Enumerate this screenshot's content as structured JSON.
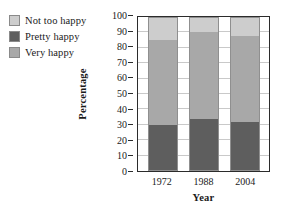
{
  "chart_data": {
    "type": "bar",
    "stacked": true,
    "title": "",
    "xlabel": "Year",
    "ylabel": "Percentage",
    "categories": [
      "1972",
      "1988",
      "2004"
    ],
    "ylim": [
      0,
      100
    ],
    "yticks": [
      0,
      10,
      20,
      30,
      40,
      50,
      60,
      70,
      80,
      90,
      100
    ],
    "grid": true,
    "legend_position": "top-left",
    "series": [
      {
        "name": "Not too happy",
        "values": [
          15,
          10,
          12
        ],
        "color": "#cdcdcd"
      },
      {
        "name": "Pretty happy",
        "values": [
          55,
          56,
          56
        ],
        "color": "#a8a8a8"
      },
      {
        "name": "Very happy",
        "values": [
          30,
          34,
          32
        ],
        "color": "#5e5e5e"
      }
    ],
    "stack_order_bottom_to_top": [
      "Very happy",
      "Pretty happy",
      "Not too happy"
    ],
    "segment_tops": {
      "1972": {
        "very_happy": 30,
        "pretty_happy": 85,
        "not_too_happy": 100
      },
      "1988": {
        "very_happy": 34,
        "pretty_happy": 90,
        "not_too_happy": 100
      },
      "2004": {
        "very_happy": 32,
        "pretty_happy": 88,
        "not_too_happy": 100
      }
    }
  },
  "legend": {
    "items": [
      {
        "label": "Not too happy",
        "color": "#cdcdcd"
      },
      {
        "label": "Pretty happy",
        "color": "#5e5e5e"
      },
      {
        "label": "Very happy",
        "color": "#a8a8a8"
      }
    ]
  },
  "axes": {
    "y_title": "Percentage",
    "x_title": "Year",
    "y_tick_labels": [
      "100",
      "90",
      "80",
      "70",
      "60",
      "50",
      "40",
      "30",
      "20",
      "10",
      "0"
    ],
    "x_tick_labels": [
      "1972",
      "1988",
      "2004"
    ]
  },
  "colors": {
    "axis": "#2b2b2b",
    "gridline": "#c9c9c9",
    "background": "#ffffff",
    "light_gray": "#cdcdcd",
    "medium_gray": "#a8a8a8",
    "dark_gray": "#5e5e5e"
  }
}
